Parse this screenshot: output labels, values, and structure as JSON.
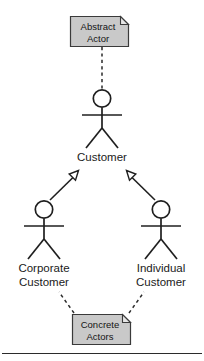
{
  "diagram": {
    "type": "uml-use-case-actor-generalization",
    "background_color": "#ffffff",
    "line_color": "#1f1f1f",
    "note_fill_color": "#c9c9c9",
    "note_border_color": "#3a3a3a",
    "notes": [
      {
        "id": "abstract-actor-note",
        "line1": "Abstract",
        "line2": "Actor",
        "anchor": "customer-actor",
        "connector": "dashed"
      },
      {
        "id": "concrete-actors-note",
        "line1": "Concrete",
        "line2": "Actors",
        "anchor": "corporate-customer-actor, individual-customer-actor",
        "connector": "dashed"
      }
    ],
    "actors": [
      {
        "id": "customer-actor",
        "label": "Customer",
        "stereotype": "abstract"
      },
      {
        "id": "corporate-customer-actor",
        "label_line1": "Corporate",
        "label_line2": "Customer",
        "stereotype": "concrete"
      },
      {
        "id": "individual-customer-actor",
        "label_line1": "Individual",
        "label_line2": "Customer",
        "stereotype": "concrete"
      }
    ],
    "relationships": [
      {
        "id": "gen-corporate-to-customer",
        "kind": "generalization",
        "from": "Corporate Customer",
        "to": "Customer",
        "arrowhead": "hollow-triangle"
      },
      {
        "id": "gen-individual-to-customer",
        "kind": "generalization",
        "from": "Individual Customer",
        "to": "Customer",
        "arrowhead": "hollow-triangle"
      }
    ]
  }
}
